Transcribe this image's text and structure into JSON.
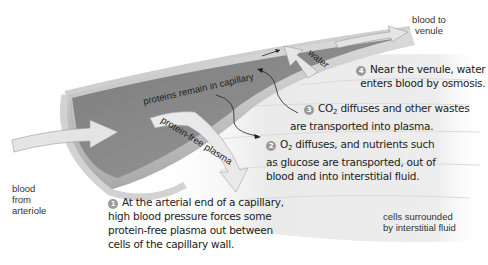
{
  "diagram": {
    "labels": {
      "blood_to_venule_1": "blood to",
      "blood_to_venule_2": "venule",
      "blood_from_1": "blood",
      "blood_from_2": "from",
      "blood_from_3": "arteriole",
      "cells_1": "cells surrounded",
      "cells_2": "by interstitial fluid",
      "proteins_remain": "proteins remain in capillary",
      "protein_free_plasma": "protein-free plasma",
      "water": "water"
    },
    "steps": [
      {
        "number": "1",
        "lines": [
          "At the arterial end of a capillary,",
          "high blood pressure forces some",
          "protein-free plasma out between",
          "cells of the capillary wall."
        ]
      },
      {
        "number": "2",
        "prefix": "O",
        "prefix_sub": "2",
        "lines": [
          " diffuses, and nutrients such",
          "as glucose are transported, out of",
          "blood and into interstitial fluid."
        ]
      },
      {
        "number": "3",
        "prefix": "CO",
        "prefix_sub": "2",
        "lines": [
          " diffuses and other wastes",
          "are transported into plasma."
        ]
      },
      {
        "number": "4",
        "lines": [
          "Near the venule, water",
          "enters blood by osmosis."
        ]
      }
    ],
    "colors": {
      "tube_inner": "#8a8a8a",
      "tube_wall": "#c8c8c8",
      "arrow_fill": "#e4e4e4",
      "cells": "#ececec",
      "badge": "#9a9a9a"
    }
  }
}
